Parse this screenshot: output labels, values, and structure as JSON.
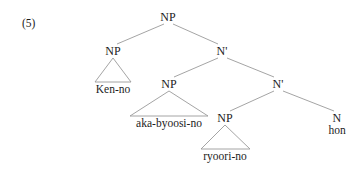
{
  "figure": {
    "example_number": "(5)",
    "line_color": "#9a9a9a",
    "text_color": "#1c1c1c",
    "background": "#ffffff"
  },
  "tree": {
    "nodes": [
      {
        "id": "np-root",
        "label": "NP",
        "x": 168,
        "y": 17
      },
      {
        "id": "np-ken",
        "label": "NP",
        "x": 113,
        "y": 51
      },
      {
        "id": "nbar-1",
        "label": "N'",
        "x": 222,
        "y": 51
      },
      {
        "id": "np-aka",
        "label": "NP",
        "x": 169,
        "y": 84
      },
      {
        "id": "nbar-2",
        "label": "N'",
        "x": 278,
        "y": 84
      },
      {
        "id": "np-ryoori",
        "label": "NP",
        "x": 225,
        "y": 118
      },
      {
        "id": "n-hon",
        "label": "N",
        "x": 337,
        "y": 118
      }
    ],
    "terminals": [
      {
        "id": "ken-no",
        "label": "Ken-no",
        "x": 113,
        "y": 89
      },
      {
        "id": "aka-byoosi-no",
        "label": "aka-byoosi-no",
        "x": 169,
        "y": 123
      },
      {
        "id": "ryoori-no",
        "label": "ryoori-no",
        "x": 225,
        "y": 156
      },
      {
        "id": "hon",
        "label": "hon",
        "x": 337,
        "y": 130
      }
    ],
    "branches": [
      {
        "id": "root-to-np-ken",
        "x1": 164,
        "y1": 24,
        "x2": 117,
        "y2": 44
      },
      {
        "id": "root-to-nbar-1",
        "x1": 173,
        "y1": 24,
        "x2": 218,
        "y2": 44
      },
      {
        "id": "nbar1-to-np-aka",
        "x1": 218,
        "y1": 58,
        "x2": 174,
        "y2": 77
      },
      {
        "id": "nbar1-to-nbar-2",
        "x1": 227,
        "y1": 58,
        "x2": 274,
        "y2": 77
      },
      {
        "id": "nbar2-to-np-ryoori",
        "x1": 274,
        "y1": 91,
        "x2": 230,
        "y2": 111
      },
      {
        "id": "nbar2-to-n-hon",
        "x1": 283,
        "y1": 91,
        "x2": 334,
        "y2": 111
      }
    ],
    "triangles": [
      {
        "id": "triangle-ken-no",
        "apex_x": 113,
        "apex_y": 58,
        "left_x": 95,
        "right_x": 131,
        "base_y": 82
      },
      {
        "id": "triangle-aka-byoosi-no",
        "apex_x": 169,
        "apex_y": 91,
        "left_x": 130,
        "right_x": 208,
        "base_y": 116
      },
      {
        "id": "triangle-ryoori-no",
        "apex_x": 225,
        "apex_y": 125,
        "left_x": 201,
        "right_x": 250,
        "base_y": 149
      }
    ]
  }
}
